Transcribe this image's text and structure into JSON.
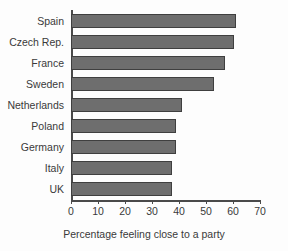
{
  "chart_data": {
    "type": "bar",
    "orientation": "horizontal",
    "title": "",
    "xlabel": "Percentage feeling close to a party",
    "ylabel": "",
    "categories": [
      "Spain",
      "Czech Rep.",
      "France",
      "Sweden",
      "Netherlands",
      "Poland",
      "Germany",
      "Italy",
      "UK"
    ],
    "values": [
      61,
      60.5,
      57,
      53,
      41,
      39,
      39,
      37.5,
      37.5
    ],
    "xlim": [
      0,
      70
    ],
    "xticks": [
      0,
      10,
      20,
      30,
      40,
      50,
      60,
      70
    ],
    "xtick_labels": [
      "0",
      "10",
      "20",
      "30",
      "40",
      "50",
      "60",
      "70"
    ],
    "grid": false,
    "legend": null,
    "series": [
      {
        "name": "Percentage feeling close to a party",
        "values": [
          61,
          60.5,
          57,
          53,
          41,
          39,
          39,
          37.5,
          37.5
        ]
      }
    ]
  },
  "style": {
    "bar_fill": "#6e6e6e",
    "bar_border": "#3f3f3f",
    "axis_color": "#4a4a4a",
    "text_color": "#3a3a3a",
    "background": "#fdfdfd"
  }
}
